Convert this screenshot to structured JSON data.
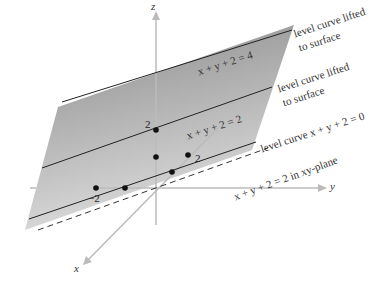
{
  "axes": {
    "x": "x",
    "y": "y",
    "z": "z"
  },
  "ticks": {
    "z_2": "2",
    "y_2": "2",
    "y_neg2": "−2"
  },
  "plane_labels": {
    "top": "x + y + 2 = 4",
    "middle": "x + y + 2 = 2",
    "xy_plane": "x + y + 2 = 2 in xy-plane"
  },
  "annotations": {
    "lifted_1_line1": "level curve lifted",
    "lifted_1_line2": "to surface",
    "lifted_2_line1": "level curve lifted",
    "lifted_2_line2": "to surface",
    "level_zero": "level curve x + y + 2 = 0"
  },
  "colors": {
    "plane_top": "#8a8a8a",
    "plane_bottom": "#d8d8d8",
    "axis": "#bbbbbb",
    "curve": "#222222"
  }
}
